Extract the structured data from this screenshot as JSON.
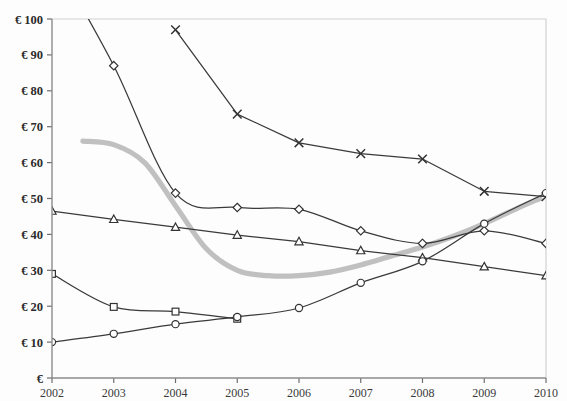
{
  "chart_data": {
    "type": "line",
    "title": "",
    "xlabel": "",
    "ylabel": "",
    "categories": [
      2002,
      2003,
      2004,
      2005,
      2006,
      2007,
      2008,
      2009,
      2010
    ],
    "xlim": [
      2002,
      2010
    ],
    "ylim": [
      0,
      100
    ],
    "ytick_labels": [
      "€",
      "€ 10",
      "€ 20",
      "€ 30",
      "€ 40",
      "€ 50",
      "€ 60",
      "€ 70",
      "€ 80",
      "€ 90",
      "€ 100"
    ],
    "ytick_values": [
      0,
      10,
      20,
      30,
      40,
      50,
      60,
      70,
      80,
      90,
      100
    ],
    "xtick_labels": [
      "2002",
      "2003",
      "2004",
      "2005",
      "2006",
      "2007",
      "2008",
      "2009",
      "2010"
    ],
    "grid": false,
    "legend": "none",
    "currency": "EUR",
    "series": [
      {
        "name": "series-diamond",
        "marker": "diamond",
        "color": "#3a3a3a",
        "x": [
          2002,
          2003,
          2004,
          2005,
          2006,
          2007,
          2008,
          2009,
          2010
        ],
        "values": [
          118,
          87,
          51.5,
          47.5,
          47,
          41,
          37.5,
          41,
          37.5
        ],
        "clipped_above_axis_max": true
      },
      {
        "name": "series-cross",
        "marker": "x",
        "color": "#3a3a3a",
        "x": [
          2004,
          2005,
          2006,
          2007,
          2008,
          2009,
          2010
        ],
        "values": [
          97,
          73.5,
          65.5,
          62.5,
          61,
          52,
          50.5
        ]
      },
      {
        "name": "series-triangle",
        "marker": "triangle",
        "color": "#3a3a3a",
        "x": [
          2002,
          2003,
          2004,
          2005,
          2006,
          2007,
          2008,
          2009,
          2010
        ],
        "values": [
          46.5,
          44.2,
          42,
          39.8,
          38,
          35.5,
          33.5,
          31,
          28.5
        ]
      },
      {
        "name": "series-square",
        "marker": "square",
        "color": "#3a3a3a",
        "x": [
          2002,
          2003,
          2004,
          2005
        ],
        "values": [
          29,
          19.8,
          18.5,
          16.5
        ]
      },
      {
        "name": "series-circle",
        "marker": "circle",
        "color": "#3a3a3a",
        "x": [
          2002,
          2003,
          2004,
          2005,
          2006,
          2007,
          2008,
          2009,
          2010
        ],
        "values": [
          10,
          12.3,
          15,
          17,
          19.5,
          26.5,
          32.5,
          43,
          51.5
        ]
      },
      {
        "name": "series-trend-grey",
        "marker": "none",
        "color": "#bdbdbd",
        "style": "thick-smooth",
        "x": [
          2002.5,
          2003,
          2003.5,
          2004,
          2004.5,
          2005,
          2005.5,
          2006,
          2006.5,
          2007,
          2007.5,
          2008,
          2008.5,
          2009,
          2009.5,
          2009.9
        ],
        "values": [
          66,
          65,
          60,
          48,
          36,
          30,
          28.5,
          28.5,
          29.5,
          31.5,
          34,
          36.5,
          39.5,
          43,
          47,
          50
        ]
      }
    ]
  }
}
